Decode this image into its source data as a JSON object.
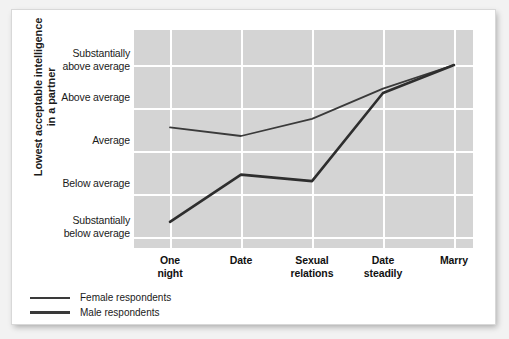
{
  "chart_data": {
    "type": "line",
    "title": "",
    "xlabel": "",
    "ylabel": "Lowest acceptable intelligence in a partner",
    "ylabel_lines": [
      "Lowest acceptable intelligence",
      "in a partner"
    ],
    "categories": [
      "One night",
      "Date",
      "Sexual relations",
      "Date steadily",
      "Marry"
    ],
    "category_lines": [
      [
        "One",
        "night"
      ],
      [
        "Date"
      ],
      [
        "Sexual",
        "relations"
      ],
      [
        "Date",
        "steadily"
      ],
      [
        "Marry"
      ]
    ],
    "ytick_labels": [
      "Substantially above average",
      "Above average",
      "Average",
      "Below average",
      "Substantially below average"
    ],
    "ytick_lines": [
      [
        "Substantially",
        "above average"
      ],
      [
        "Above average"
      ],
      [
        "Average"
      ],
      [
        "Below average"
      ],
      [
        "Substantially",
        "below average"
      ]
    ],
    "ytick_values": [
      5,
      4,
      3,
      2,
      1
    ],
    "ylim": [
      0.5,
      5.5
    ],
    "grid": true,
    "legend_position": "bottom-left",
    "series": [
      {
        "name": "Female respondents",
        "values": [
          3.55,
          3.35,
          3.75,
          4.45,
          5.0
        ],
        "color": "#3a3a3a",
        "line_width": 1.6
      },
      {
        "name": "Male respondents",
        "values": [
          1.35,
          2.45,
          2.3,
          4.35,
          5.0
        ],
        "color": "#2e2e2e",
        "line_width": 2.4
      }
    ],
    "plot_background": "#d4d4d4",
    "grid_color": "#ffffff",
    "page_background": "#ffffff"
  },
  "legend": {
    "items": [
      {
        "label": "Female respondents",
        "swatch": "female-line-swatch",
        "thickness": 1.6
      },
      {
        "label": "Male respondents",
        "swatch": "male-line-swatch",
        "thickness": 2.6
      }
    ]
  }
}
